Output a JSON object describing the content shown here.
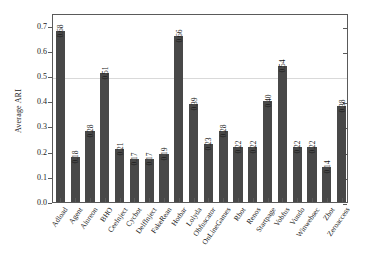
{
  "chart_data": {
    "type": "bar",
    "title": "",
    "xlabel": "",
    "ylabel": "Average ARI",
    "ylim": [
      0.0,
      0.75
    ],
    "yticks": [
      "0.0",
      "0.1",
      "0.2",
      "0.3",
      "0.4",
      "0.5",
      "0.6",
      "0.7"
    ],
    "ytick_values": [
      0.0,
      0.1,
      0.2,
      0.3,
      0.4,
      0.5,
      0.6,
      0.7
    ],
    "grid": "horizontal line at 0.5 only",
    "legend": "none",
    "bar_color": "#484848",
    "frame_color": "#5a5a5a",
    "gridline_color": "#d9d9d9",
    "categories": [
      "Adload",
      "Agent",
      "Alureon",
      "BHO",
      "CeeInject",
      "Cycbot",
      "DelfInject",
      "FakeRean",
      "Hotbar",
      "Lolyda",
      "Obfuscator",
      "OnLineGames",
      "Rbot",
      "Renos",
      "Startpage",
      "Vobfus",
      "Vundo",
      "Winwebsec",
      "Zbot",
      "Zeroaccess"
    ],
    "values": [
      0.68,
      0.18,
      0.28,
      0.51,
      0.21,
      0.17,
      0.17,
      0.19,
      0.66,
      0.39,
      0.23,
      0.28,
      0.22,
      0.22,
      0.4,
      0.54,
      0.22,
      0.22,
      0.14,
      0.38
    ],
    "value_labels": [
      "0.68",
      "0.18",
      "0.28",
      "0.51",
      "0.21",
      "0.17",
      "0.17",
      "0.19",
      "0.66",
      "0.39",
      "0.23",
      "0.28",
      "0.22",
      "0.22",
      "0.40",
      "0.54",
      "0.22",
      "0.22",
      "0.14",
      "0.38"
    ]
  }
}
